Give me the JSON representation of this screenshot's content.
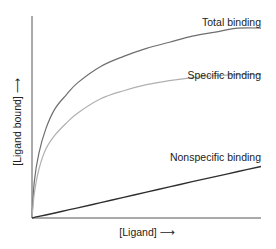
{
  "chart_data": {
    "type": "line",
    "title": "",
    "xlabel": "[Ligand] ⟶",
    "ylabel": "[Ligand bound] ⟶",
    "xlim": [
      0,
      10
    ],
    "ylim": [
      0,
      10
    ],
    "grid": false,
    "legend": "inline labels at right end of each curve",
    "x": [
      0,
      0.1,
      0.3,
      0.6,
      1,
      1.5,
      2,
      3,
      4,
      5,
      6,
      7,
      8,
      9,
      10
    ],
    "series": [
      {
        "name": "Total binding",
        "color": "#6e6e6e",
        "values": [
          0,
          1.8,
          3.2,
          4.4,
          5.4,
          6.1,
          6.7,
          7.5,
          8.0,
          8.4,
          8.7,
          9.0,
          9.2,
          9.4,
          9.4
        ]
      },
      {
        "name": "Specific binding",
        "color": "#b0b0b0",
        "values": [
          0,
          1.2,
          2.4,
          3.4,
          4.1,
          4.7,
          5.2,
          5.9,
          6.3,
          6.6,
          6.8,
          6.95,
          7.05,
          7.1,
          7.1
        ]
      },
      {
        "name": "Nonspecific binding",
        "color": "#2e2e2e",
        "values": [
          0,
          0.03,
          0.08,
          0.15,
          0.25,
          0.38,
          0.5,
          0.76,
          1.02,
          1.28,
          1.54,
          1.8,
          2.05,
          2.3,
          2.55
        ]
      }
    ]
  },
  "labels": {
    "total": "Total binding",
    "specific": "Specific binding",
    "nonspecific": "Nonspecific binding",
    "xaxis": "[Ligand] ⟶",
    "yaxis": "[Ligand bound] ⟶"
  }
}
